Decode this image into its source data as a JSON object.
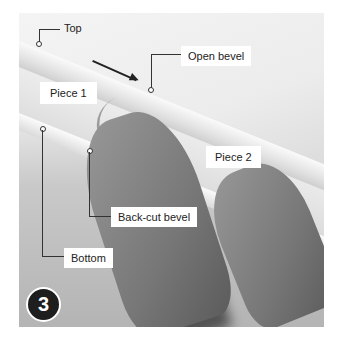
{
  "figure": {
    "step_number": "3",
    "labels": {
      "top": "Top",
      "open_bevel": "Open bevel",
      "piece_1": "Piece 1",
      "piece_2": "Piece 2",
      "back_cut_bevel": "Back-cut bevel",
      "bottom": "Bottom"
    },
    "colors": {
      "badge_background": "#1e1e1e",
      "badge_text": "#ffffff",
      "label_background": "#ffffff",
      "leader_line": "#333333"
    }
  }
}
